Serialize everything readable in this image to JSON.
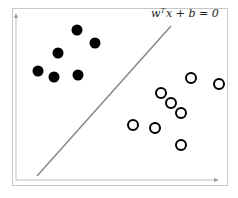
{
  "diagram": {
    "type": "linear-classifier-hyperplane",
    "equation": {
      "prefix": "w",
      "superscript": "T",
      "rest": "x + b = 0"
    },
    "caption": "",
    "colors": {
      "filled_points": "#000000",
      "hollow_points": "#000000",
      "boundary_line": "#888888",
      "axes": "#c0c0c0",
      "frame": "#c8c8c8"
    },
    "class_positive": [
      {
        "x": 77,
        "y": 30
      },
      {
        "x": 95,
        "y": 43
      },
      {
        "x": 58,
        "y": 53
      },
      {
        "x": 38,
        "y": 71
      },
      {
        "x": 54,
        "y": 77
      },
      {
        "x": 78,
        "y": 75
      }
    ],
    "class_negative": [
      {
        "x": 191,
        "y": 78
      },
      {
        "x": 219,
        "y": 84
      },
      {
        "x": 161,
        "y": 93
      },
      {
        "x": 171,
        "y": 103
      },
      {
        "x": 181,
        "y": 113
      },
      {
        "x": 133,
        "y": 125
      },
      {
        "x": 155,
        "y": 128
      },
      {
        "x": 181,
        "y": 145
      }
    ],
    "boundary": {
      "x1": 37,
      "y1": 176,
      "x2": 171,
      "y2": 26
    }
  }
}
